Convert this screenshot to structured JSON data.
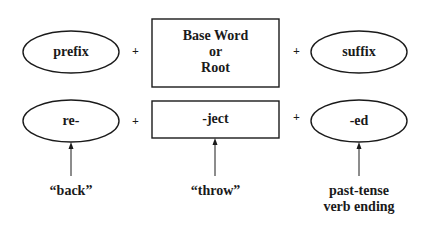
{
  "diagram": {
    "row1": {
      "prefix": "prefix",
      "base": [
        "Base Word",
        "or",
        "Root"
      ],
      "suffix": "suffix"
    },
    "row2": {
      "prefix": "re-",
      "base": "-ject",
      "suffix": "-ed"
    },
    "operator": "+",
    "meanings": {
      "prefix": "“back”",
      "base": "“throw”",
      "suffix": [
        "past-tense",
        "verb ending"
      ]
    }
  }
}
